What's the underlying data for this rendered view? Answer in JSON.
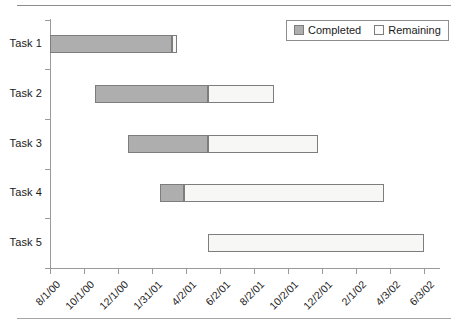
{
  "chart_data": {
    "type": "bar",
    "subtype": "gantt",
    "title": "",
    "xlabel": "",
    "ylabel": "",
    "grid": false,
    "orientation": "horizontal",
    "categories": [
      "Task 1",
      "Task 2",
      "Task 3",
      "Task 4",
      "Task 5"
    ],
    "x_tick_labels": [
      "8/1/00",
      "10/1/00",
      "12/1/00",
      "1/31/01",
      "4/2/01",
      "6/2/01",
      "8/2/01",
      "10/2/01",
      "12/2/01",
      "2/1/02",
      "4/3/02",
      "6/3/02"
    ],
    "x_tick_positions_px": [
      50,
      84,
      118,
      152,
      186,
      220,
      254,
      288,
      322,
      356,
      390,
      424
    ],
    "xlim_labels": [
      "8/1/00",
      "6/3/02"
    ],
    "legend": {
      "position": "top-right",
      "entries": [
        {
          "label": "Completed",
          "color": "#aeaeae"
        },
        {
          "label": "Remaining",
          "color": "#f7f7f5"
        }
      ]
    },
    "series": [
      {
        "name": "Completed",
        "color": "#aeaeae"
      },
      {
        "name": "Remaining",
        "color": "#f7f7f5"
      }
    ],
    "bars": [
      {
        "category": "Task 1",
        "start_label": "8/1/00",
        "start_px": 50,
        "completed_end_px": 172,
        "end_px": 177,
        "completed_px": 122,
        "remaining_px": 5
      },
      {
        "category": "Task 2",
        "start_label": "10/28/00",
        "start_px": 95,
        "completed_end_px": 208,
        "end_px": 274,
        "completed_px": 113,
        "remaining_px": 66
      },
      {
        "category": "Task 3",
        "start_label": "12/26/00",
        "start_px": 128,
        "completed_end_px": 208,
        "end_px": 318,
        "completed_px": 80,
        "remaining_px": 110
      },
      {
        "category": "Task 4",
        "start_label": "2/26/01",
        "start_px": 160,
        "completed_end_px": 184,
        "end_px": 384,
        "completed_px": 24,
        "remaining_px": 200
      },
      {
        "category": "Task 5",
        "start_label": "5/14/01",
        "start_px": 208,
        "completed_end_px": 208,
        "end_px": 424,
        "completed_px": 0,
        "remaining_px": 216
      }
    ],
    "y_tick_positions_px": [
      20,
      69,
      119,
      169,
      218,
      268
    ],
    "band_centers_px": [
      44,
      94,
      144,
      193,
      243
    ],
    "plot_area_px": {
      "left": 50,
      "top": 20,
      "right": 440,
      "bottom": 268
    }
  }
}
